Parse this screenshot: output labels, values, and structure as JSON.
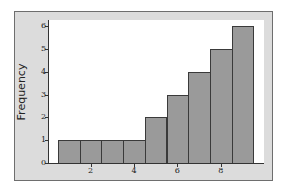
{
  "chart_data": {
    "type": "bar",
    "title": "",
    "xlabel": "",
    "ylabel": "Frequency",
    "categories": [
      "1",
      "2",
      "3",
      "4",
      "5",
      "6",
      "7",
      "8",
      "9"
    ],
    "values": [
      1,
      1,
      1,
      1,
      2,
      3,
      4,
      5,
      6
    ],
    "x_ticks": [
      "2",
      "4",
      "6",
      "8"
    ],
    "y_ticks": [
      "0",
      "1",
      "2",
      "3",
      "4",
      "5",
      "6"
    ],
    "ylim": [
      0,
      6.3
    ],
    "xlim": [
      0.1,
      10
    ],
    "grid": false,
    "legend": null,
    "colors": {
      "bar_fill": "#9a9a9a",
      "bar_edge": "#3a3a3a",
      "frame": "#dcdcdc",
      "plot_bg": "#ffffff"
    }
  }
}
